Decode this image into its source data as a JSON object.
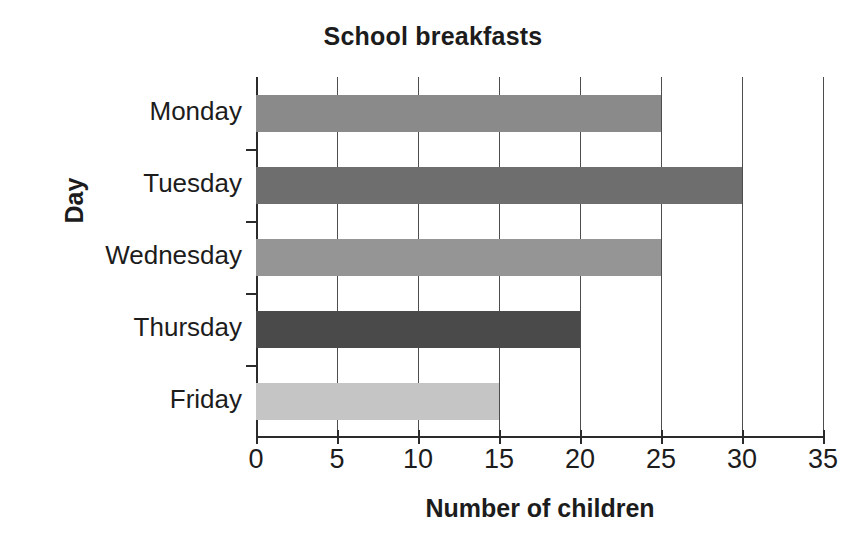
{
  "chart_data": {
    "type": "bar",
    "orientation": "horizontal",
    "title": "School breakfasts",
    "xlabel": "Number of children",
    "ylabel": "Day",
    "categories": [
      "Monday",
      "Tuesday",
      "Wednesday",
      "Thursday",
      "Friday"
    ],
    "values": [
      25,
      30,
      25,
      20,
      15
    ],
    "bar_colors": [
      "#8a8a8a",
      "#6e6e6e",
      "#959595",
      "#4a4a4a",
      "#c5c5c5"
    ],
    "xlim": [
      0,
      35
    ],
    "xticks": [
      0,
      5,
      10,
      15,
      20,
      25,
      30,
      35
    ],
    "xtick_labels": [
      "0",
      "5",
      "10",
      "15",
      "20",
      "25",
      "30",
      "35"
    ],
    "grid": "vertical",
    "legend": "none",
    "axis_color": "#2b2b2b",
    "background": "#ffffff"
  }
}
